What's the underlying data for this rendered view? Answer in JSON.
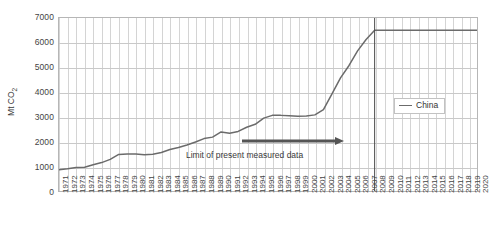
{
  "chart_data": {
    "type": "line",
    "title": "",
    "subtitle": "",
    "xlabel": "",
    "ylabel": "Mt CO2",
    "ylabel_display": "Mt CO₂",
    "xlim": [
      1971,
      2020
    ],
    "ylim": [
      0,
      7000
    ],
    "y_ticks": [
      0,
      1000,
      2000,
      3000,
      4000,
      5000,
      6000,
      7000
    ],
    "y_tick_labels": [
      "0",
      "1000",
      "2000",
      "3000",
      "4000",
      "5000",
      "6000",
      "7000"
    ],
    "grid": true,
    "grid_x": true,
    "grid_y": true,
    "legend_position": "right-middle",
    "legend_entries": [
      "China"
    ],
    "line_color": "#6b6b6b",
    "x": [
      1971,
      1972,
      1973,
      1974,
      1975,
      1976,
      1977,
      1978,
      1979,
      1980,
      1981,
      1982,
      1983,
      1984,
      1985,
      1986,
      1987,
      1988,
      1989,
      1990,
      1991,
      1992,
      1993,
      1994,
      1995,
      1996,
      1997,
      1998,
      1999,
      2000,
      2001,
      2002,
      2003,
      2004,
      2005,
      2006,
      2007,
      2008,
      2009,
      2010,
      2011,
      2012,
      2013,
      2014,
      2015,
      2016,
      2017,
      2018,
      2019,
      2020
    ],
    "x_tick_labels": [
      "1971",
      "1972",
      "1973",
      "1974",
      "1975",
      "1976",
      "1977",
      "1978",
      "1979",
      "1980",
      "1981",
      "1982",
      "1983",
      "1984",
      "1985",
      "1986",
      "1987",
      "1988",
      "1989",
      "1990",
      "1991",
      "1992",
      "1993",
      "1994",
      "1995",
      "1996",
      "1997",
      "1998",
      "1999",
      "2000",
      "2001",
      "2002",
      "2003",
      "2004",
      "2005",
      "2006",
      "2007",
      "2008",
      "2009",
      "2010",
      "2011",
      "2012",
      "2013",
      "2014",
      "2015",
      "2016",
      "2017",
      "2018",
      "2019",
      "2020"
    ],
    "series": [
      {
        "name": "China",
        "color": "#6b6b6b",
        "values": [
          860,
          900,
          950,
          960,
          1060,
          1150,
          1280,
          1480,
          1500,
          1500,
          1470,
          1490,
          1560,
          1680,
          1760,
          1860,
          1980,
          2120,
          2180,
          2390,
          2340,
          2410,
          2580,
          2700,
          2950,
          3060,
          3060,
          3040,
          3020,
          3030,
          3080,
          3290,
          3930,
          4580,
          5080,
          5670,
          6130,
          6500,
          6500,
          6500,
          6500,
          6500,
          6500,
          6500,
          6500,
          6500,
          6500,
          6500,
          6500,
          6500
        ]
      }
    ],
    "annotations": [
      {
        "text": "Limit of present measured data",
        "type": "arrow-label",
        "arrow_direction": "right",
        "arrow_end_year": 2008
      },
      {
        "type": "vertical-line",
        "year": 2008,
        "label": ""
      }
    ]
  }
}
